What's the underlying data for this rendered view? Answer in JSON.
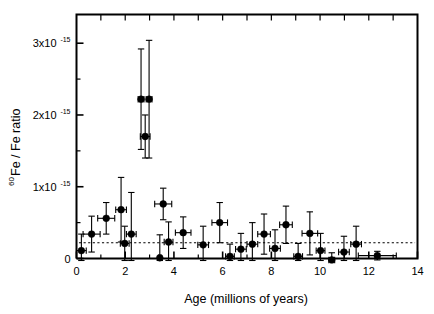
{
  "chart_data": {
    "type": "scatter",
    "title": "",
    "xlabel": "Age (millions of years)",
    "ylabel": "60Fe / Fe ratio",
    "ylabel_parts": {
      "superscript": "60",
      "rest": "Fe / Fe ratio"
    },
    "xlim": [
      0,
      14
    ],
    "ylim": [
      0,
      3.4
    ],
    "y_units": "1e-15",
    "grid": false,
    "legend": null,
    "xticks": [
      0,
      2,
      4,
      6,
      8,
      10,
      12,
      14
    ],
    "xticklabels": [
      "0",
      "2",
      "4",
      "6",
      "8",
      "10",
      "12",
      "14"
    ],
    "x_minor_tick_interval": 1,
    "yticks": [
      0,
      1,
      2,
      3
    ],
    "yticklabels": [
      "0",
      "1x10",
      "2x10",
      "3x10"
    ],
    "ytick_exponent": "-15",
    "y_minor_tick_interval": 0.5,
    "reference_line": {
      "style": "dotted",
      "y": 0.22,
      "x_start": 0.1,
      "x_end": 13.9,
      "label": ""
    },
    "points": [
      {
        "x": 0.2,
        "y": 0.11,
        "xerr_lo": 0.2,
        "xerr_hi": 0.2,
        "yerr": 0.23
      },
      {
        "x": 0.62,
        "y": 0.34,
        "xerr_lo": 0.35,
        "xerr_hi": 0.35,
        "yerr": 0.25
      },
      {
        "x": 1.22,
        "y": 0.56,
        "xerr_lo": 0.35,
        "xerr_hi": 0.35,
        "yerr": 0.22
      },
      {
        "x": 1.83,
        "y": 0.68,
        "xerr_lo": 0.22,
        "xerr_hi": 0.22,
        "yerr": 0.45
      },
      {
        "x": 1.98,
        "y": 0.21,
        "xerr_lo": 0.18,
        "xerr_hi": 0.18,
        "yerr": 0.24
      },
      {
        "x": 2.25,
        "y": 0.34,
        "xerr_lo": 0.2,
        "xerr_hi": 0.2,
        "yerr": 0.58
      },
      {
        "x": 2.65,
        "y": 2.22,
        "xerr_lo": 0.12,
        "xerr_hi": 0.12,
        "yerr": 0.7
      },
      {
        "x": 2.98,
        "y": 2.22,
        "xerr_lo": 0.12,
        "xerr_hi": 0.12,
        "yerr": 0.82
      },
      {
        "x": 2.82,
        "y": 1.7,
        "xerr_lo": 0.2,
        "xerr_hi": 0.2,
        "yerr": 0.3
      },
      {
        "x": 3.42,
        "y": 0.01,
        "xerr_lo": 0.05,
        "xerr_hi": 0.05,
        "yerr": 0.32
      },
      {
        "x": 3.56,
        "y": 0.76,
        "xerr_lo": 0.35,
        "xerr_hi": 0.35,
        "yerr": 0.22
      },
      {
        "x": 3.78,
        "y": 0.23,
        "xerr_lo": 0.18,
        "xerr_hi": 0.18,
        "yerr": 0.28
      },
      {
        "x": 4.38,
        "y": 0.36,
        "xerr_lo": 0.32,
        "xerr_hi": 0.32,
        "yerr": 0.22
      },
      {
        "x": 5.2,
        "y": 0.19,
        "xerr_lo": 0.22,
        "xerr_hi": 0.22,
        "yerr": 0.26
      },
      {
        "x": 5.88,
        "y": 0.5,
        "xerr_lo": 0.32,
        "xerr_hi": 0.32,
        "yerr": 0.28
      },
      {
        "x": 6.3,
        "y": 0.03,
        "xerr_lo": 0.18,
        "xerr_hi": 0.18,
        "yerr": 0.17
      },
      {
        "x": 6.75,
        "y": 0.13,
        "xerr_lo": 0.22,
        "xerr_hi": 0.22,
        "yerr": 0.22
      },
      {
        "x": 7.22,
        "y": 0.2,
        "xerr_lo": 0.22,
        "xerr_hi": 0.22,
        "yerr": 0.3
      },
      {
        "x": 7.7,
        "y": 0.34,
        "xerr_lo": 0.26,
        "xerr_hi": 0.26,
        "yerr": 0.28
      },
      {
        "x": 8.15,
        "y": 0.14,
        "xerr_lo": 0.22,
        "xerr_hi": 0.22,
        "yerr": 0.26
      },
      {
        "x": 8.6,
        "y": 0.47,
        "xerr_lo": 0.26,
        "xerr_hi": 0.26,
        "yerr": 0.26
      },
      {
        "x": 9.1,
        "y": 0.03,
        "xerr_lo": 0.18,
        "xerr_hi": 0.18,
        "yerr": 0.18
      },
      {
        "x": 9.58,
        "y": 0.35,
        "xerr_lo": 0.32,
        "xerr_hi": 0.32,
        "yerr": 0.3
      },
      {
        "x": 10.02,
        "y": 0.11,
        "xerr_lo": 0.18,
        "xerr_hi": 0.18,
        "yerr": 0.24
      },
      {
        "x": 10.48,
        "y": -0.02,
        "xerr_lo": 0.12,
        "xerr_hi": 0.12,
        "yerr": 0.1
      },
      {
        "x": 10.98,
        "y": 0.09,
        "xerr_lo": 0.22,
        "xerr_hi": 0.22,
        "yerr": 0.22
      },
      {
        "x": 11.48,
        "y": 0.2,
        "xerr_lo": 0.22,
        "xerr_hi": 0.22,
        "yerr": 0.25
      },
      {
        "x": 12.35,
        "y": 0.04,
        "xerr_lo": 0.78,
        "xerr_hi": 0.78,
        "yerr": 0.06
      }
    ]
  }
}
